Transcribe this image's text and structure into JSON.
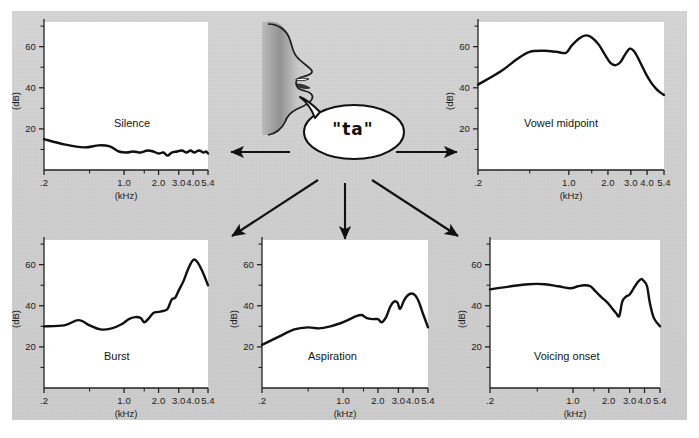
{
  "figure": {
    "background_color": "#cfcfcf",
    "plot_background_color": "#ffffff",
    "curve_color": "#111111",
    "center": {
      "bubble_text": "\"ta\"",
      "face_icon": "speaking-head-profile-icon",
      "bubble_icon": "speech-bubble-icon",
      "arrow_icon": "arrow-icon",
      "arrow_count": 5
    }
  },
  "chart_data": [
    {
      "type": "line",
      "title": "Silence",
      "xlabel": "(kHz)",
      "ylabel": "(dB)",
      "xlim": [
        0.2,
        5.4
      ],
      "ylim": [
        0,
        72
      ],
      "xscale": "log",
      "grid": false,
      "legend": "none",
      "xticks": [
        ".2",
        "1.0",
        "2.0",
        "3.0",
        "4.0",
        "5.4"
      ],
      "xtick_values": [
        0.2,
        1.0,
        2.0,
        3.0,
        4.0,
        5.4
      ],
      "yticks": [
        "20",
        "40",
        "60"
      ],
      "ytick_values": [
        20,
        40,
        60
      ],
      "yminor_values": [
        10,
        30,
        50,
        70
      ],
      "x": [
        0.2,
        0.3,
        0.45,
        0.6,
        0.75,
        0.9,
        1.05,
        1.2,
        1.4,
        1.6,
        1.8,
        2.0,
        2.2,
        2.4,
        2.6,
        2.9,
        3.2,
        3.5,
        3.8,
        4.1,
        4.5,
        4.9,
        5.2,
        5.4
      ],
      "values": [
        15,
        12.5,
        11,
        12,
        11.5,
        9,
        8.5,
        9,
        8.5,
        9.5,
        9,
        8,
        8.5,
        7,
        8.5,
        9,
        9.5,
        8.5,
        9.5,
        8.5,
        9.5,
        8.5,
        9,
        8
      ]
    },
    {
      "type": "line",
      "title": "Vowel midpoint",
      "xlabel": "(kHz)",
      "ylabel": "(dB)",
      "xlim": [
        0.2,
        5.4
      ],
      "ylim": [
        0,
        72
      ],
      "xscale": "log",
      "grid": false,
      "legend": "none",
      "xticks": [
        ".2",
        "1.0",
        "2.0",
        "3.0",
        "4.0",
        "5.4"
      ],
      "xtick_values": [
        0.2,
        1.0,
        2.0,
        3.0,
        4.0,
        5.4
      ],
      "yticks": [
        "20",
        "40",
        "60"
      ],
      "ytick_values": [
        20,
        40,
        60
      ],
      "yminor_values": [
        10,
        30,
        50,
        70
      ],
      "x": [
        0.2,
        0.3,
        0.4,
        0.5,
        0.65,
        0.8,
        0.95,
        1.05,
        1.2,
        1.35,
        1.5,
        1.7,
        1.9,
        2.1,
        2.3,
        2.5,
        2.7,
        2.95,
        3.2,
        3.5,
        3.9,
        4.3,
        4.7,
        5.1,
        5.4
      ],
      "values": [
        41.5,
        48,
        54,
        57.5,
        58,
        57.5,
        57,
        60.5,
        64,
        65.5,
        64.5,
        61,
        56,
        52,
        51,
        52.5,
        56,
        59,
        57.5,
        53,
        47,
        42.5,
        39.5,
        37.5,
        36.5
      ]
    },
    {
      "type": "line",
      "title": "Burst",
      "xlabel": "(kHz)",
      "ylabel": "(dB)",
      "xlim": [
        0.2,
        5.4
      ],
      "ylim": [
        0,
        72
      ],
      "xscale": "log",
      "grid": false,
      "legend": "none",
      "xticks": [
        ".2",
        "1.0",
        "2.0",
        "3.0",
        "4.0",
        "5.4"
      ],
      "xtick_values": [
        0.2,
        1.0,
        2.0,
        3.0,
        4.0,
        5.4
      ],
      "yticks": [
        "20",
        "40",
        "60"
      ],
      "ytick_values": [
        20,
        40,
        60
      ],
      "yminor_values": [
        10,
        30,
        50,
        70
      ],
      "x": [
        0.2,
        0.3,
        0.4,
        0.5,
        0.62,
        0.78,
        0.95,
        1.1,
        1.25,
        1.4,
        1.5,
        1.65,
        1.8,
        2.0,
        2.2,
        2.4,
        2.6,
        2.8,
        3.0,
        3.3,
        3.6,
        3.9,
        4.1,
        4.4,
        4.8,
        5.4
      ],
      "values": [
        30,
        30.5,
        33,
        30.5,
        28.5,
        29,
        31,
        33.5,
        34.5,
        34,
        32,
        34,
        36.5,
        37,
        37.5,
        38.5,
        43,
        44,
        47.5,
        52,
        57.5,
        61.5,
        62.5,
        61,
        57,
        50
      ]
    },
    {
      "type": "line",
      "title": "Aspiration",
      "xlabel": "(kHz)",
      "ylabel": "(dB)",
      "xlim": [
        0.2,
        5.4
      ],
      "ylim": [
        0,
        72
      ],
      "xscale": "log",
      "grid": false,
      "legend": "none",
      "xticks": [
        ".2",
        "1.0",
        "2.0",
        "3.0",
        "4.0",
        "5.4"
      ],
      "xtick_values": [
        0.2,
        1.0,
        2.0,
        3.0,
        4.0,
        5.4
      ],
      "yticks": [
        "20",
        "40",
        "60"
      ],
      "ytick_values": [
        20,
        40,
        60
      ],
      "yminor_values": [
        10,
        30,
        50,
        70
      ],
      "x": [
        0.2,
        0.28,
        0.38,
        0.5,
        0.62,
        0.78,
        0.95,
        1.1,
        1.3,
        1.45,
        1.6,
        1.8,
        2.0,
        2.15,
        2.35,
        2.55,
        2.75,
        2.95,
        3.1,
        3.35,
        3.6,
        3.9,
        4.2,
        4.5,
        4.9,
        5.4
      ],
      "values": [
        21,
        25,
        28.5,
        29.5,
        29,
        30,
        31.5,
        33,
        35,
        35.5,
        34,
        33.5,
        33.5,
        32,
        34.5,
        39.5,
        42,
        41.5,
        38.5,
        42.5,
        45,
        46,
        45,
        42,
        36,
        29.5
      ]
    },
    {
      "type": "line",
      "title": "Voicing onset",
      "xlabel": "(kHz)",
      "ylabel": "(dB)",
      "xlim": [
        0.2,
        5.4
      ],
      "ylim": [
        0,
        72
      ],
      "xscale": "log",
      "grid": false,
      "legend": "none",
      "xticks": [
        ".2",
        "1.0",
        "2.0",
        "3.0",
        "4.0",
        "5.4"
      ],
      "xtick_values": [
        0.2,
        1.0,
        2.0,
        3.0,
        4.0,
        5.4
      ],
      "yticks": [
        "20",
        "40",
        "60"
      ],
      "ytick_values": [
        20,
        40,
        60
      ],
      "yminor_values": [
        10,
        30,
        50,
        70
      ],
      "x": [
        0.2,
        0.3,
        0.42,
        0.58,
        0.75,
        0.95,
        1.1,
        1.25,
        1.4,
        1.55,
        1.75,
        1.95,
        2.15,
        2.3,
        2.45,
        2.6,
        2.8,
        3.0,
        3.2,
        3.5,
        3.75,
        3.95,
        4.2,
        4.45,
        4.8,
        5.4
      ],
      "values": [
        48,
        49.5,
        50.5,
        50.5,
        49.5,
        48.5,
        49.5,
        50,
        49.5,
        47,
        44,
        41.5,
        38.5,
        36.5,
        35,
        42,
        44.5,
        45.5,
        48,
        51.5,
        53,
        52,
        49.5,
        41,
        34,
        30
      ]
    }
  ]
}
